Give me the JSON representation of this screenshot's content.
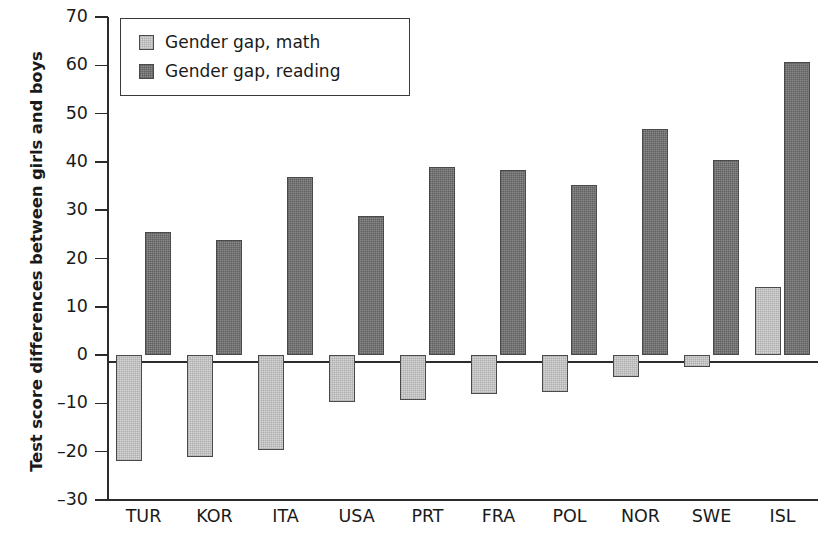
{
  "chart_data": {
    "type": "bar",
    "title": "",
    "xlabel": "",
    "ylabel": "Test score differences between girls and boys",
    "ylim": [
      -30,
      70
    ],
    "yticks": [
      -30,
      -20,
      -10,
      0,
      10,
      20,
      30,
      40,
      50,
      60,
      70
    ],
    "ytick_labels": [
      "–30",
      "–20",
      "–10",
      "0",
      "10",
      "20",
      "30",
      "40",
      "50",
      "60",
      "70"
    ],
    "grid": false,
    "legend_position": "top-left",
    "categories": [
      "TUR",
      "KOR",
      "ITA",
      "USA",
      "PRT",
      "FRA",
      "POL",
      "NOR",
      "SWE",
      "ISL"
    ],
    "series": [
      {
        "name": "Gender gap, math",
        "color": "#d6d6d6",
        "values": [
          -22.0,
          -21.2,
          -19.7,
          -9.8,
          -9.2,
          -8.1,
          -7.6,
          -4.5,
          -2.5,
          14.2
        ]
      },
      {
        "name": "Gender gap, reading",
        "color": "#8a8a8a",
        "values": [
          25.5,
          23.9,
          36.9,
          28.9,
          39.0,
          38.4,
          35.3,
          46.8,
          40.4,
          60.6
        ]
      }
    ]
  },
  "legend": {
    "items": [
      {
        "label": "Gender gap, math",
        "swatch": "math"
      },
      {
        "label": "Gender gap, reading",
        "swatch": "reading"
      }
    ]
  },
  "axes": {
    "y_title": "Test score differences between girls and boys",
    "zero_value": 0
  },
  "colors": {
    "math_fill": "#d6d6d6",
    "reading_fill": "#8a8a8a",
    "bar_border": "#4a4a4a",
    "axis": "#2b2b2b",
    "text": "#1a1a1a",
    "background": "#ffffff"
  }
}
